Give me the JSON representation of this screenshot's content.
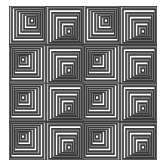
{
  "artwork": {
    "grid": {
      "rows": 4,
      "cols": 4
    },
    "colors": {
      "line": "#3a3a3a",
      "shade_dark": "#7a7a7a",
      "shade_light": "#bdbdbd",
      "paper": "#ffffff"
    },
    "rings": 7,
    "tiles": [
      [
        "up-right",
        "down-right",
        "up-right",
        "down-right"
      ],
      [
        "up-left",
        "down-right",
        "up-left",
        "down-right"
      ],
      [
        "up-left",
        "down-right",
        "up-left",
        "down-right"
      ],
      [
        "up-left",
        "down-right",
        "up-left",
        "down-right"
      ]
    ]
  }
}
